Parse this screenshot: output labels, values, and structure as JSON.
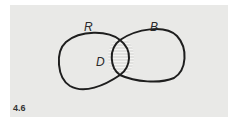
{
  "figure": {
    "number": "4.6",
    "labels": {
      "left_set": "R",
      "right_set": "B",
      "intersection": "D"
    },
    "colors": {
      "panel": "#e9e9e7",
      "stroke": "#1e1e1e",
      "hatch": "#bdbdbd"
    }
  }
}
